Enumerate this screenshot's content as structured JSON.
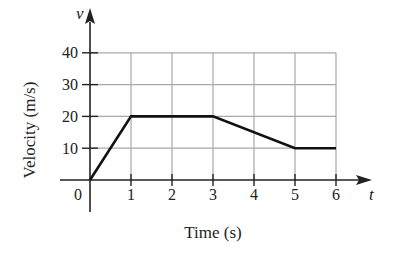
{
  "chart_data": {
    "type": "line",
    "title": "",
    "xlabel": "Time (s)",
    "ylabel": "Velocity (m/s)",
    "x_axis_symbol": "t",
    "y_axis_symbol": "v",
    "x": [
      0,
      1,
      3,
      5,
      6
    ],
    "series": [
      {
        "name": "velocity",
        "values": [
          0,
          20,
          20,
          10,
          10
        ]
      }
    ],
    "xlim": [
      0,
      6
    ],
    "ylim": [
      0,
      40
    ],
    "x_ticks": [
      "0",
      "1",
      "2",
      "3",
      "4",
      "5",
      "6"
    ],
    "y_ticks": [
      "10",
      "20",
      "30",
      "40"
    ],
    "grid": true,
    "legend": null
  },
  "colors": {
    "line": "#111111",
    "grid": "#a8a8a8",
    "axis": "#222222",
    "text": "#222222"
  }
}
